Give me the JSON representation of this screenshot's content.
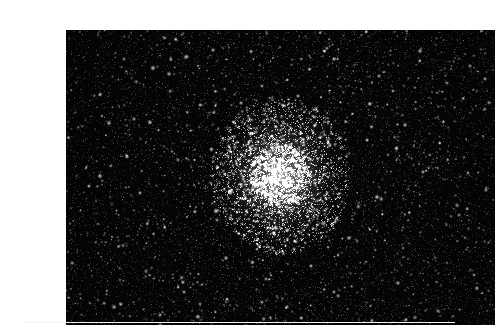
{
  "page": {
    "background_color": "#ffffff",
    "width": 480,
    "height": 328,
    "caption": ""
  },
  "figure": {
    "name": "globular-cluster-photograph",
    "alt_text": "Deep-sky astrophotograph of a globular star cluster in a dense star field",
    "frame": {
      "x": 26,
      "y": 14,
      "width": 429,
      "height": 295
    },
    "sky_background_color": "#040404",
    "star_color": "#ffffff",
    "rule_color": "#f2f2f4"
  },
  "chart_data": {
    "type": "scatter",
    "title": "",
    "xlabel": "",
    "ylabel": "",
    "xlim": [
      0,
      429
    ],
    "ylim": [
      0,
      295
    ],
    "grid": false,
    "legend": "none",
    "background": "#040404",
    "annotations": [],
    "cluster": {
      "name": "globular-cluster",
      "center_x": 214,
      "center_y": 146,
      "halo_radius_x": 48,
      "halo_radius_y": 54,
      "core_radius_x": 20,
      "core_radius_y": 22,
      "core_peak_brightness": 170,
      "halo_member_count": 2600,
      "core_member_count": 900
    },
    "field": {
      "name": "background-star-field",
      "faint_star_count": 9000,
      "medium_star_count": 900,
      "bright_star_count": 120,
      "brightest_magnitude_gray": 255,
      "faintest_magnitude_gray": 26
    },
    "bright_stars": [
      {
        "x": 87,
        "y": 38,
        "r": 1.6,
        "v": 222
      },
      {
        "x": 120,
        "y": 27,
        "r": 1.5,
        "v": 210
      },
      {
        "x": 147,
        "y": 20,
        "r": 1.3,
        "v": 198
      },
      {
        "x": 58,
        "y": 29,
        "r": 1.2,
        "v": 186
      },
      {
        "x": 103,
        "y": 44,
        "r": 1.4,
        "v": 205
      },
      {
        "x": 68,
        "y": 89,
        "r": 1.3,
        "v": 192
      },
      {
        "x": 43,
        "y": 93,
        "r": 1.5,
        "v": 214
      },
      {
        "x": 175,
        "y": 73,
        "r": 1.3,
        "v": 196
      },
      {
        "x": 196,
        "y": 56,
        "r": 1.2,
        "v": 184
      },
      {
        "x": 232,
        "y": 66,
        "r": 1.3,
        "v": 190
      },
      {
        "x": 268,
        "y": 29,
        "r": 1.4,
        "v": 204
      },
      {
        "x": 313,
        "y": 46,
        "r": 1.3,
        "v": 193
      },
      {
        "x": 354,
        "y": 21,
        "r": 1.5,
        "v": 216
      },
      {
        "x": 381,
        "y": 53,
        "r": 1.2,
        "v": 182
      },
      {
        "x": 404,
        "y": 36,
        "r": 1.3,
        "v": 191
      },
      {
        "x": 419,
        "y": 79,
        "r": 1.2,
        "v": 180
      },
      {
        "x": 339,
        "y": 95,
        "r": 1.4,
        "v": 206
      },
      {
        "x": 301,
        "y": 110,
        "r": 1.3,
        "v": 195
      },
      {
        "x": 262,
        "y": 92,
        "r": 1.2,
        "v": 178
      },
      {
        "x": 34,
        "y": 146,
        "r": 1.5,
        "v": 218
      },
      {
        "x": 74,
        "y": 163,
        "r": 1.3,
        "v": 189
      },
      {
        "x": 112,
        "y": 130,
        "r": 1.2,
        "v": 177
      },
      {
        "x": 150,
        "y": 181,
        "r": 1.6,
        "v": 228
      },
      {
        "x": 184,
        "y": 117,
        "r": 1.3,
        "v": 193
      },
      {
        "x": 311,
        "y": 167,
        "r": 1.5,
        "v": 220
      },
      {
        "x": 357,
        "y": 142,
        "r": 1.3,
        "v": 194
      },
      {
        "x": 393,
        "y": 185,
        "r": 1.2,
        "v": 179
      },
      {
        "x": 420,
        "y": 160,
        "r": 1.3,
        "v": 188
      },
      {
        "x": 283,
        "y": 208,
        "r": 1.4,
        "v": 202
      },
      {
        "x": 245,
        "y": 236,
        "r": 1.3,
        "v": 190
      },
      {
        "x": 200,
        "y": 249,
        "r": 1.2,
        "v": 176
      },
      {
        "x": 160,
        "y": 228,
        "r": 1.4,
        "v": 201
      },
      {
        "x": 118,
        "y": 262,
        "r": 1.3,
        "v": 187
      },
      {
        "x": 80,
        "y": 241,
        "r": 1.2,
        "v": 175
      },
      {
        "x": 48,
        "y": 277,
        "r": 1.5,
        "v": 212
      },
      {
        "x": 94,
        "y": 285,
        "r": 1.3,
        "v": 190
      },
      {
        "x": 134,
        "y": 274,
        "r": 1.2,
        "v": 174
      },
      {
        "x": 221,
        "y": 277,
        "r": 1.3,
        "v": 186
      },
      {
        "x": 268,
        "y": 262,
        "r": 1.2,
        "v": 173
      },
      {
        "x": 332,
        "y": 253,
        "r": 1.4,
        "v": 199
      },
      {
        "x": 372,
        "y": 281,
        "r": 1.3,
        "v": 185
      },
      {
        "x": 408,
        "y": 245,
        "r": 1.2,
        "v": 172
      },
      {
        "x": 165,
        "y": 161,
        "r": 1.7,
        "v": 240
      },
      {
        "x": 226,
        "y": 129,
        "r": 1.5,
        "v": 224
      }
    ]
  }
}
